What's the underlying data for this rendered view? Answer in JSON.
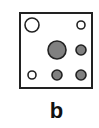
{
  "panel": {
    "label": "b",
    "frame": {
      "x": 1,
      "y": 1,
      "width": 72,
      "height": 75
    },
    "colors": {
      "stroke": "#222222",
      "filled": "#808080",
      "hollow": "#ffffff"
    },
    "circles": [
      {
        "id": "top-left",
        "cx": 13,
        "cy": 13,
        "r": 7,
        "filled": false
      },
      {
        "id": "top-right",
        "cx": 62,
        "cy": 13,
        "r": 4,
        "filled": false
      },
      {
        "id": "center",
        "cx": 38,
        "cy": 38,
        "r": 9,
        "filled": true
      },
      {
        "id": "middle-right",
        "cx": 62,
        "cy": 38,
        "r": 5,
        "filled": true
      },
      {
        "id": "bottom-left",
        "cx": 13,
        "cy": 63,
        "r": 4,
        "filled": false
      },
      {
        "id": "bottom-middle",
        "cx": 38,
        "cy": 63,
        "r": 5,
        "filled": true
      },
      {
        "id": "bottom-right",
        "cx": 62,
        "cy": 63,
        "r": 5,
        "filled": true
      }
    ]
  }
}
